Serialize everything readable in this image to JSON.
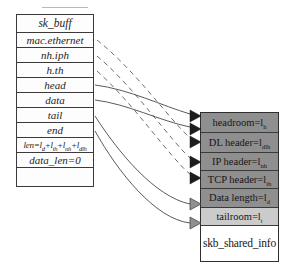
{
  "struct_table": {
    "title": "sk_buff",
    "fields": [
      "mac.ethernet",
      "nh.iph",
      "h.th",
      "head",
      "data",
      "tail",
      "end"
    ],
    "len_formula_parts": [
      "len=l",
      "d",
      "+l",
      "th",
      "+l",
      "nh",
      "+l",
      "dlh"
    ],
    "data_len_field": "data_len=0"
  },
  "buffer_box": {
    "rows": [
      {
        "text": "headroom=l",
        "sub": "h"
      },
      {
        "text": "DL header=l",
        "sub": "dlh"
      },
      {
        "text": "IP header=l",
        "sub": "nh"
      },
      {
        "text": "TCP header=l",
        "sub": "th"
      },
      {
        "text": "Data length=l",
        "sub": "d"
      },
      {
        "text": "tailroom=l",
        "sub": "t"
      },
      {
        "text": "skb_shared_info",
        "sub": ""
      }
    ]
  },
  "arrows": {
    "solid_pointers": [
      "head",
      "data",
      "tail",
      "end"
    ],
    "dashed_pointers": [
      "mac.ethernet",
      "nh.iph",
      "h.th"
    ]
  },
  "colors": {
    "row_dark": "#8f8f8f",
    "row_light": "#cbcbcb",
    "row_white": "#ffffff",
    "line": "#474747",
    "arrowhead_black": "#1d1d1d",
    "arrowhead_gray": "#909090"
  }
}
